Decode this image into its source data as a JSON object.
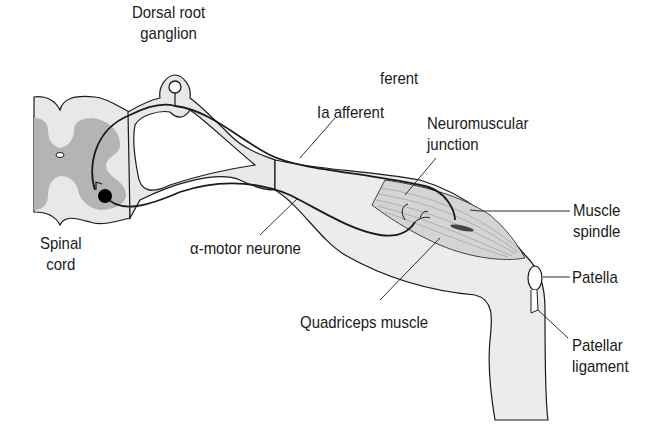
{
  "diagram": {
    "type": "knee-jerk stretch reflex arc",
    "colors": {
      "white_matter": "#e8e8e8",
      "grey_matter": "#b4b4b4",
      "limb": "#ececec",
      "outline": "#1a1a1a",
      "text": "#1a1a1a"
    }
  },
  "labels": {
    "dorsal_root_ganglion": [
      "Dorsal root",
      "ganglion"
    ],
    "spinal_cord": [
      "Spinal",
      "cord"
    ],
    "efferent_fragment": "ferent",
    "ia_afferent": "Ia afferent",
    "neuromuscular_junction": [
      "Neuromuscular",
      "junction"
    ],
    "alpha_motor_neurone": "α-motor neurone",
    "muscle_spindle": [
      "Muscle",
      "spindle"
    ],
    "patella": "Patella",
    "quadriceps_muscle": "Quadriceps muscle",
    "patellar_ligament": [
      "Patellar",
      "ligament"
    ]
  }
}
